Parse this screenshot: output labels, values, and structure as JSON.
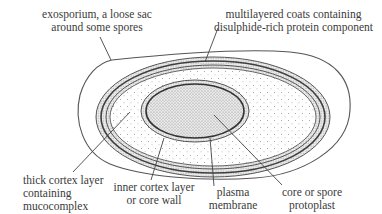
{
  "diagram": {
    "colors": {
      "outline": "#555555",
      "stipple": "#9a9a9a",
      "core_fill": "#b8b8b8",
      "background": "#ffffff",
      "text": "#3a3a3a"
    },
    "labels": {
      "exosporium": {
        "line1": "exosporium, a loose sac",
        "line2": "around some spores"
      },
      "coats": {
        "line1": "multilayered coats containing",
        "line2": "disulphide-rich protein component"
      },
      "cortex": {
        "line1": "thick cortex layer",
        "line2": "containing",
        "line3": "mucocomplex"
      },
      "inner_cortex": {
        "line1": "inner cortex layer",
        "line2": "or core wall"
      },
      "plasma_membrane": {
        "line1": "plasma",
        "line2": "membrane"
      },
      "core": {
        "line1": "core or spore",
        "line2": "protoplast"
      }
    }
  }
}
